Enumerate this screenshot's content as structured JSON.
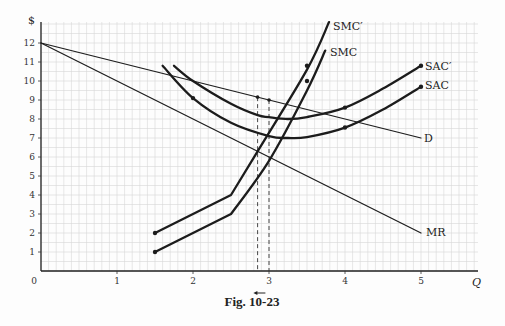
{
  "figure": {
    "caption": "Fig. 10-23"
  },
  "chart_data": {
    "type": "line",
    "title": "",
    "caption": "Fig. 10-23",
    "xlabel": "Q",
    "ylabel": "$",
    "xlim": [
      0,
      5.8
    ],
    "ylim": [
      0,
      12.9
    ],
    "x_ticks": [
      "0",
      "1",
      "2",
      "3",
      "4",
      "5"
    ],
    "y_ticks": [
      "1",
      "2",
      "3",
      "4",
      "5",
      "6",
      "7",
      "8",
      "9",
      "10",
      "11",
      "12"
    ],
    "grid": true,
    "series": [
      {
        "name": "D",
        "points": [
          [
            0,
            12
          ],
          [
            5,
            7
          ]
        ]
      },
      {
        "name": "MR",
        "points": [
          [
            0,
            12
          ],
          [
            5,
            2
          ]
        ]
      },
      {
        "name": "SMC",
        "points": [
          [
            1.5,
            1
          ],
          [
            2.5,
            3
          ],
          [
            3,
            5.8
          ],
          [
            3.5,
            9.5
          ],
          [
            3.74,
            11.6
          ]
        ],
        "markers": [
          [
            1.5,
            1
          ],
          [
            3.5,
            10
          ]
        ]
      },
      {
        "name": "SMC'",
        "points": [
          [
            1.5,
            2
          ],
          [
            2.5,
            4
          ],
          [
            2.85,
            6.3
          ],
          [
            3.5,
            10.6
          ],
          [
            3.79,
            13.1
          ]
        ],
        "markers": [
          [
            1.5,
            2
          ],
          [
            3.5,
            10.8
          ]
        ]
      },
      {
        "name": "SAC",
        "points": [
          [
            1.6,
            10.8
          ],
          [
            2,
            9.1
          ],
          [
            2.5,
            7.8
          ],
          [
            3,
            7.1
          ],
          [
            3.25,
            7
          ],
          [
            3.5,
            7.05
          ],
          [
            4,
            7.55
          ],
          [
            4.5,
            8.5
          ],
          [
            5,
            9.7
          ]
        ],
        "markers": [
          [
            2,
            9.1
          ],
          [
            4,
            7.55
          ],
          [
            5,
            9.7
          ]
        ]
      },
      {
        "name": "SAC'",
        "points": [
          [
            1.75,
            10.8
          ],
          [
            2,
            10
          ],
          [
            2.5,
            8.8
          ],
          [
            2.85,
            8.2
          ],
          [
            3,
            8.1
          ],
          [
            3.25,
            8
          ],
          [
            3.5,
            8.1
          ],
          [
            4,
            8.6
          ],
          [
            4.5,
            9.6
          ],
          [
            5,
            10.8
          ]
        ],
        "markers": [
          [
            4,
            8.6
          ],
          [
            5,
            10.8
          ]
        ]
      }
    ],
    "annotations": [
      {
        "type": "dashed-vline",
        "x": 2.85,
        "from_y": 0,
        "to_y": 9.15
      },
      {
        "type": "dashed-vline",
        "x": 3.0,
        "from_y": 0,
        "to_y": 9.0
      },
      {
        "type": "arrow",
        "at_x": 2.9,
        "direction": "left",
        "note": "below Q axis"
      }
    ],
    "labels": {
      "D": "D",
      "MR": "MR",
      "SMC": "SMC",
      "SMCp": "SMC′",
      "SAC": "SAC",
      "SACp": "SAC′",
      "Q": "Q",
      "dollar": "$",
      "origin": "0"
    }
  }
}
